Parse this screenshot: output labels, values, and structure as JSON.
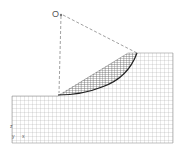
{
  "figure": {
    "center_label": "O",
    "axis_label_z": "z",
    "axis_label_y": "y",
    "axis_label_x": "x",
    "colors": {
      "mesh": "#9a9a9a",
      "mesh_dense": "#555555",
      "slip_surface": "#222222",
      "dashed": "#777777",
      "background": "#ffffff"
    }
  }
}
